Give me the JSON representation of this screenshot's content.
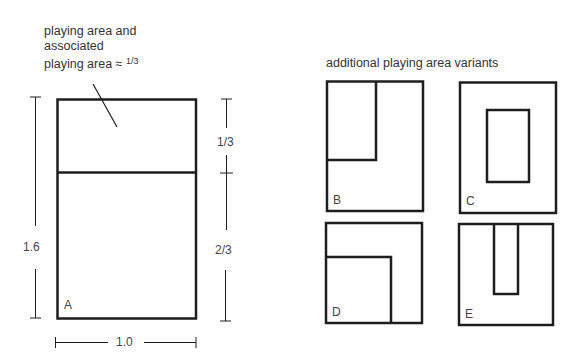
{
  "figure_a": {
    "callout_line1": "playing area and",
    "callout_line2": "associated",
    "callout_line3_prefix": "playing area ≈ ",
    "callout_fraction": "1/3",
    "label": "A",
    "dim_height": "1.6",
    "dim_width": "1.0",
    "dim_top_section": "1/3",
    "dim_bottom_section": "2/3"
  },
  "variants": {
    "title": "additional playing area variants",
    "items": [
      {
        "label": "B",
        "description": "playing area in top-left corner"
      },
      {
        "label": "C",
        "description": "playing area centered"
      },
      {
        "label": "D",
        "description": "playing area in bottom-left corner"
      },
      {
        "label": "E",
        "description": "playing area as central strip from top"
      }
    ]
  },
  "colors": {
    "line": "#1e1e1e",
    "text": "#333333",
    "background": "#ffffff"
  }
}
